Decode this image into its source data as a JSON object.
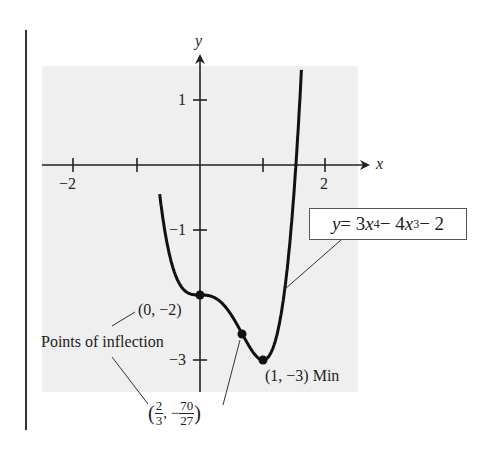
{
  "chart_data": {
    "type": "line",
    "title": "",
    "function": "y = 3x^4 - 4x^3 - 2",
    "xlabel": "x",
    "ylabel": "y",
    "xlim": [
      -2.5,
      2.5
    ],
    "ylim": [
      -3.5,
      1.5
    ],
    "x_ticks": [
      -2,
      -1,
      1,
      2
    ],
    "x_tick_labels": [
      "-2",
      "",
      "",
      "2"
    ],
    "y_ticks": [
      1,
      -1,
      -3
    ],
    "y_tick_labels": [
      "1",
      "-1",
      "-3"
    ],
    "grid": false,
    "series": [
      {
        "name": "y = 3x^4 - 4x^3 - 2",
        "x": [
          -0.63,
          -0.5,
          -0.25,
          0,
          0.25,
          0.5,
          0.6667,
          0.75,
          1,
          1.25,
          1.5,
          1.63
        ],
        "y": [
          1.46,
          -1.31,
          -1.92,
          -2,
          -2.05,
          -2.31,
          -2.59,
          -2.74,
          -3,
          -2.49,
          -0.31,
          1.5
        ]
      }
    ],
    "points": [
      {
        "label": "(0, -2)",
        "x": 0,
        "y": -2,
        "type": "inflection"
      },
      {
        "label": "(2/3, -70/27)",
        "x": 0.6667,
        "y": -2.5926,
        "type": "inflection"
      },
      {
        "label": "(1, -3) Min",
        "x": 1,
        "y": -3,
        "type": "minimum"
      }
    ],
    "annotations": [
      "Points of inflection",
      "(0, -2)",
      "(2/3, -70/27)",
      "(1, -3) Min",
      "y = 3x^4 - 4x^3 - 2"
    ]
  },
  "axes": {
    "x_label": "x",
    "y_label": "y"
  },
  "ticks": {
    "x_neg2": "−2",
    "x_2": "2",
    "y_1": "1",
    "y_neg1": "−1",
    "y_neg3": "−3"
  },
  "labels": {
    "inflection_title": "Points of inflection",
    "point_a": "(0, −2)",
    "point_b_open": "(",
    "point_b_x_num": "2",
    "point_b_x_den": "3",
    "point_b_sep": ", −",
    "point_b_y_num": "70",
    "point_b_y_den": "27",
    "point_b_close": ")",
    "min_point": "(1, −3) Min"
  },
  "equation": {
    "y": "y",
    "eq": " = 3",
    "x1": "x",
    "p1": "4",
    "mid": " − 4",
    "x2": "x",
    "p2": "3",
    "tail": " − 2"
  }
}
